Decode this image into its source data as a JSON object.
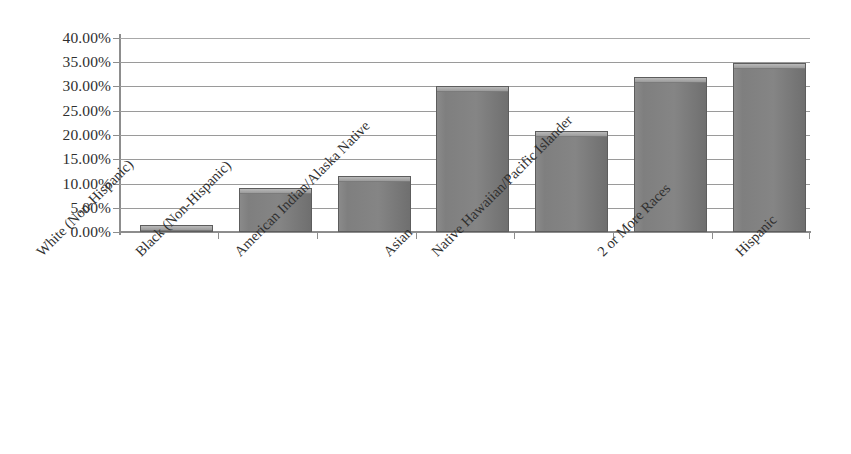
{
  "chart_data": {
    "type": "bar",
    "title": "",
    "subtitle": "",
    "xlabel": "",
    "ylabel": "",
    "ylim": [
      0,
      0.4
    ],
    "grid": true,
    "legend": false,
    "legend_position": "none",
    "orientation": "vertical",
    "value_format": "percent",
    "categories": [
      "White (Non-Hispanic)",
      "Black (Non-Hispanic)",
      "American Indian/Alaska Native",
      "Asian",
      "Native Hawaiian/Pacific Islander",
      "2 or More Races",
      "Hispanic"
    ],
    "values": [
      1.5,
      9.0,
      11.5,
      30.0,
      20.75,
      32.0,
      34.8
    ],
    "value_labels": [
      "1.50%",
      "9.00%",
      "11.50%",
      "30.00%",
      "20.75%",
      "32.00%",
      "34.80%"
    ],
    "ytick_labels": [
      "40.00%",
      "35.00%",
      "30.00%",
      "25.00%",
      "20.00%",
      "15.00%",
      "10.00%",
      "5.00%",
      "0.00%"
    ],
    "ytick_values": [
      40,
      35,
      30,
      25,
      20,
      15,
      10,
      5,
      0
    ],
    "series": [
      {
        "name": "Percent",
        "color": "#808080",
        "values": [
          1.5,
          9.0,
          11.5,
          30.0,
          20.75,
          32.0,
          34.8
        ]
      }
    ],
    "colors": {
      "bar_fill": "#808080",
      "bar_edge": "#5d5d5d",
      "bar_highlight": "#b9b9b9",
      "gridline": "#9a9a9a",
      "axis": "#8d8d8d",
      "text": "#2f2f2f",
      "background": "#ffffff"
    }
  }
}
